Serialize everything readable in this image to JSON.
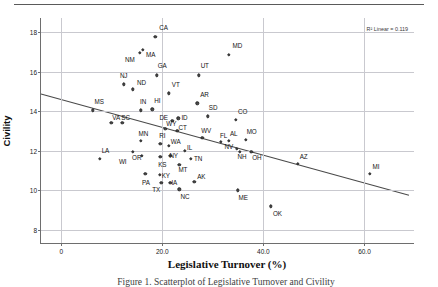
{
  "figure": {
    "ylabel": "Civility",
    "xlabel": "Legislative Turnover (%)",
    "r2_note": "R² Linear = 0.119",
    "caption": "Figure 1. Scatterplot of Legislative Turnover and Civility"
  },
  "chart_data": {
    "type": "scatter",
    "title": "",
    "xlabel": "Legislative Turnover (%)",
    "ylabel": "Civility",
    "xlim": [
      -4,
      70
    ],
    "ylim": [
      7.3,
      18.7
    ],
    "xticks": [
      "0",
      "20.0",
      "40.0",
      "60.0"
    ],
    "xtick_values": [
      0,
      20,
      40,
      60
    ],
    "yticks": [
      "8",
      "10",
      "12",
      "14",
      "16",
      "18"
    ],
    "ytick_values": [
      8,
      10,
      12,
      14,
      16,
      18
    ],
    "grid": true,
    "legend": "none",
    "r_squared": 0.119,
    "fit_line": {
      "type": "linear",
      "x_start": -4.0,
      "y_start": 14.85,
      "x_end": 69.0,
      "y_end": 9.72
    },
    "point_label_key": "state",
    "points": [
      {
        "state": "CA",
        "x": 18.6,
        "y": 17.75,
        "lx": 4,
        "ly": -10
      },
      {
        "state": "MD",
        "x": 33.1,
        "y": 16.85,
        "lx": 4,
        "ly": -10
      },
      {
        "state": "MA",
        "x": 16.2,
        "y": 17.1,
        "lx": 3,
        "ly": 4
      },
      {
        "state": "NM",
        "x": 15.6,
        "y": 16.95,
        "lx": -15,
        "ly": 6
      },
      {
        "state": "GA",
        "x": 18.9,
        "y": 15.8,
        "lx": 1,
        "ly": -10
      },
      {
        "state": "UT",
        "x": 27.2,
        "y": 15.8,
        "lx": 2,
        "ly": -10
      },
      {
        "state": "NJ",
        "x": 12.4,
        "y": 15.35,
        "lx": -4,
        "ly": -9
      },
      {
        "state": "ND",
        "x": 14.2,
        "y": 15.1,
        "lx": 4,
        "ly": -7
      },
      {
        "state": "VT",
        "x": 21.3,
        "y": 14.9,
        "lx": 3,
        "ly": -9
      },
      {
        "state": "AR",
        "x": 26.9,
        "y": 14.4,
        "lx": 3,
        "ly": -9
      },
      {
        "state": "MS",
        "x": 6.2,
        "y": 14.05,
        "lx": 2,
        "ly": -9
      },
      {
        "state": "IN",
        "x": 15.8,
        "y": 14.05,
        "lx": -1,
        "ly": -9
      },
      {
        "state": "HI",
        "x": 18.0,
        "y": 14.1,
        "lx": 2,
        "ly": -9
      },
      {
        "state": "SD",
        "x": 29.0,
        "y": 13.75,
        "lx": 1,
        "ly": -9
      },
      {
        "state": "CO",
        "x": 34.6,
        "y": 13.55,
        "lx": 2,
        "ly": -9
      },
      {
        "state": "ID",
        "x": 23.2,
        "y": 13.65,
        "lx": 3,
        "ly": -1
      },
      {
        "state": "DE",
        "x": 22.0,
        "y": 13.5,
        "lx": -13,
        "ly": -4
      },
      {
        "state": "VA",
        "x": 9.9,
        "y": 13.4,
        "lx": 1,
        "ly": -6
      },
      {
        "state": "SC",
        "x": 12.1,
        "y": 13.4,
        "lx": -1,
        "ly": -6
      },
      {
        "state": "WY",
        "x": 20.6,
        "y": 13.1,
        "lx": 1,
        "ly": -6
      },
      {
        "state": "CT",
        "x": 23.0,
        "y": 13.0,
        "lx": 1,
        "ly": -4
      },
      {
        "state": "WV",
        "x": 27.9,
        "y": 12.65,
        "lx": -1,
        "ly": -8
      },
      {
        "state": "FL",
        "x": 31.6,
        "y": 12.45,
        "lx": -1,
        "ly": -7
      },
      {
        "state": "AL",
        "x": 33.2,
        "y": 12.5,
        "lx": 1,
        "ly": -8
      },
      {
        "state": "MO",
        "x": 36.5,
        "y": 12.55,
        "lx": 1,
        "ly": -9
      },
      {
        "state": "MN",
        "x": 15.7,
        "y": 12.5,
        "lx": -2,
        "ly": -8
      },
      {
        "state": "RI",
        "x": 19.6,
        "y": 12.35,
        "lx": -1,
        "ly": -9
      },
      {
        "state": "WA",
        "x": 21.3,
        "y": 12.25,
        "lx": 2,
        "ly": -5
      },
      {
        "state": "IL",
        "x": 24.5,
        "y": 12.0,
        "lx": 2,
        "ly": -4
      },
      {
        "state": "NV",
        "x": 34.7,
        "y": 12.1,
        "lx": -12,
        "ly": -3
      },
      {
        "state": "NH",
        "x": 35.3,
        "y": 11.95,
        "lx": -2,
        "ly": 4
      },
      {
        "state": "OH",
        "x": 37.6,
        "y": 11.95,
        "lx": 1,
        "ly": 5
      },
      {
        "state": "LA",
        "x": 7.6,
        "y": 11.6,
        "lx": 2,
        "ly": -9
      },
      {
        "state": "WI",
        "x": 14.2,
        "y": 11.95,
        "lx": -14,
        "ly": 9
      },
      {
        "state": "OR",
        "x": 16.0,
        "y": 11.75,
        "lx": -10,
        "ly": 1
      },
      {
        "state": "KS",
        "x": 19.6,
        "y": 11.7,
        "lx": -2,
        "ly": 7
      },
      {
        "state": "NY",
        "x": 21.6,
        "y": 11.75,
        "lx": -1,
        "ly": -1
      },
      {
        "state": "TN",
        "x": 25.7,
        "y": 11.6,
        "lx": 3,
        "ly": -1
      },
      {
        "state": "MT",
        "x": 23.4,
        "y": 11.3,
        "lx": -1,
        "ly": 4
      },
      {
        "state": "AZ",
        "x": 46.8,
        "y": 11.35,
        "lx": 2,
        "ly": -8
      },
      {
        "state": "MI",
        "x": 61.0,
        "y": 10.85,
        "lx": 3,
        "ly": -8
      },
      {
        "state": "PA",
        "x": 16.6,
        "y": 10.85,
        "lx": -3,
        "ly": 8
      },
      {
        "state": "KY",
        "x": 19.5,
        "y": 10.8,
        "lx": 2,
        "ly": 0
      },
      {
        "state": "IA",
        "x": 21.6,
        "y": 10.4,
        "lx": 1,
        "ly": -1
      },
      {
        "state": "TX",
        "x": 19.8,
        "y": 10.4,
        "lx": -9,
        "ly": 6
      },
      {
        "state": "AK",
        "x": 26.3,
        "y": 10.45,
        "lx": 3,
        "ly": -6
      },
      {
        "state": "NC",
        "x": 23.4,
        "y": 10.05,
        "lx": 1,
        "ly": 7
      },
      {
        "state": "ME",
        "x": 34.9,
        "y": 10.0,
        "lx": 1,
        "ly": 7
      },
      {
        "state": "OK",
        "x": 41.5,
        "y": 9.2,
        "lx": 2,
        "ly": 7
      }
    ]
  }
}
